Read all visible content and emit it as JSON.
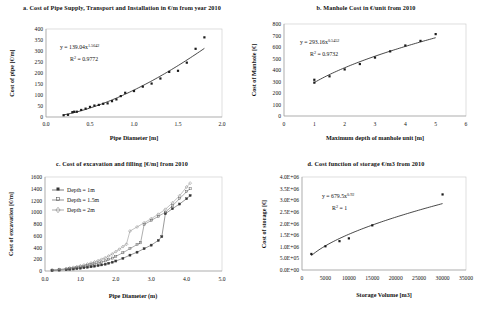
{
  "figure": {
    "name": "cost-function-figure",
    "panel_count": 4
  },
  "chart_data": [
    {
      "id": "a",
      "type": "scatter",
      "title": "a. Cost of Pipe Supply, Transport and Installation in €/m from year 2010",
      "xlabel": "Pipe Diameter [m]",
      "ylabel": "Cost of pipe [€/m]",
      "xlim": [
        0.0,
        2.0
      ],
      "ylim": [
        0,
        400
      ],
      "xticks": [
        "0.0",
        "0.5",
        "1.0",
        "1.5",
        "2.0"
      ],
      "yticks": [
        "0",
        "50",
        "100",
        "150",
        "200",
        "250",
        "300",
        "350",
        "400"
      ],
      "grid": false,
      "legend": "none",
      "equation": "y = 139.04x",
      "equation_exponent": "1.5642",
      "r_squared_label": "R",
      "r_squared_sup": "2",
      "r_squared_value": "= 0.9772",
      "trendline": "power",
      "x": [
        0.2,
        0.25,
        0.3,
        0.32,
        0.35,
        0.4,
        0.45,
        0.5,
        0.55,
        0.6,
        0.65,
        0.7,
        0.75,
        0.8,
        0.85,
        0.9,
        1.0,
        1.1,
        1.2,
        1.3,
        1.4,
        1.5,
        1.6,
        1.7,
        1.8
      ],
      "y": [
        8,
        10,
        22,
        24,
        24,
        32,
        38,
        46,
        52,
        55,
        60,
        62,
        72,
        80,
        95,
        110,
        118,
        138,
        152,
        175,
        205,
        210,
        247,
        310,
        362
      ]
    },
    {
      "id": "b",
      "type": "scatter",
      "title": "b. Manhole Cost in €/unit from 2010",
      "xlabel": "Maximum depth of manhole unit [m]",
      "ylabel": "Cost of Manhole [€]",
      "xlim": [
        0,
        6
      ],
      "ylim": [
        0,
        800
      ],
      "xticks": [
        "0",
        "1",
        "2",
        "3",
        "4",
        "5",
        "6"
      ],
      "yticks": [
        "0",
        "100",
        "200",
        "300",
        "400",
        "500",
        "600",
        "700",
        "800"
      ],
      "grid": false,
      "legend": "none",
      "equation": "y = 293.16x",
      "equation_exponent": "0.5452",
      "r_squared_label": "R",
      "r_squared_sup": "2",
      "r_squared_value": "= 0.9732",
      "trendline": "power",
      "x": [
        1.0,
        1.0,
        1.5,
        2.0,
        2.5,
        3.0,
        3.5,
        4.0,
        4.5,
        5.0
      ],
      "y": [
        290,
        315,
        345,
        405,
        452,
        508,
        562,
        613,
        653,
        712
      ]
    },
    {
      "id": "c",
      "type": "line",
      "title": "c. Cost of excavation and filling [€/m] from 2010",
      "xlabel": "Pipe Diameter (m)",
      "ylabel": "Cost of excavation [€/m]",
      "xlim": [
        0.0,
        5.0
      ],
      "ylim": [
        0,
        1600
      ],
      "xticks": [
        "0.0",
        "1.0",
        "2.0",
        "3.0",
        "4.0",
        "5.0"
      ],
      "yticks": [
        "0",
        "200",
        "400",
        "600",
        "800",
        "1000",
        "1200",
        "1400",
        "1600"
      ],
      "grid": false,
      "legend": "inside-upper-left",
      "series": [
        {
          "name": "Depth = 1m",
          "x": [
            0.2,
            0.4,
            0.6,
            0.7,
            0.8,
            0.9,
            1.0,
            1.1,
            1.2,
            1.3,
            1.4,
            1.5,
            1.6,
            1.7,
            1.8,
            1.9,
            2.0,
            2.2,
            2.4,
            2.6,
            2.8,
            3.0,
            3.2,
            3.3,
            3.4,
            3.6,
            3.8,
            4.0,
            4.1
          ],
          "y": [
            10,
            15,
            22,
            28,
            34,
            40,
            48,
            56,
            64,
            72,
            82,
            92,
            104,
            116,
            132,
            150,
            170,
            215,
            270,
            320,
            380,
            440,
            520,
            585,
            975,
            1060,
            1140,
            1230,
            1285
          ]
        },
        {
          "name": "Depth = 1.5m",
          "x": [
            0.2,
            0.4,
            0.6,
            0.7,
            0.8,
            0.9,
            1.0,
            1.1,
            1.2,
            1.3,
            1.4,
            1.5,
            1.6,
            1.7,
            1.8,
            1.9,
            2.0,
            2.2,
            2.4,
            2.6,
            2.7,
            2.8,
            3.0,
            3.2,
            3.4,
            3.6,
            3.8,
            4.0,
            4.1
          ],
          "y": [
            14,
            22,
            32,
            40,
            48,
            58,
            68,
            80,
            92,
            106,
            120,
            136,
            152,
            172,
            195,
            220,
            250,
            310,
            380,
            450,
            480,
            790,
            860,
            930,
            1000,
            1110,
            1230,
            1350,
            1400
          ]
        },
        {
          "name": "Depth = 2m",
          "x": [
            0.2,
            0.4,
            0.6,
            0.7,
            0.8,
            0.9,
            1.0,
            1.1,
            1.2,
            1.3,
            1.4,
            1.5,
            1.6,
            1.7,
            1.8,
            1.9,
            2.0,
            2.1,
            2.2,
            2.3,
            2.4,
            2.6,
            2.8,
            3.0,
            3.2,
            3.4,
            3.6,
            3.8,
            4.0,
            4.1
          ],
          "y": [
            18,
            28,
            42,
            52,
            62,
            74,
            88,
            102,
            118,
            136,
            154,
            175,
            198,
            224,
            255,
            290,
            330,
            370,
            415,
            455,
            680,
            750,
            820,
            890,
            965,
            1050,
            1160,
            1280,
            1430,
            1495
          ]
        }
      ]
    },
    {
      "id": "d",
      "type": "scatter",
      "title": "d. Cost function of storage €/m3 from 2010",
      "xlabel": "Storage Volume [m3]",
      "ylabel": "Cost of storage [€]",
      "xlim": [
        0,
        35000
      ],
      "ylim": [
        0,
        4000000
      ],
      "xticks": [
        "0",
        "5000",
        "10000",
        "15000",
        "20000",
        "25000",
        "30000",
        "35000"
      ],
      "yticks": [
        "0.0E+00",
        "5.0E+05",
        "1.0E+06",
        "1.5E+06",
        "2.0E+06",
        "2.5E+06",
        "3.0E+06",
        "3.5E+06",
        "4.0E+06"
      ],
      "grid": false,
      "legend": "none",
      "equation": "y = 679.5x",
      "equation_exponent": "0.92",
      "r_squared_label": "R",
      "r_squared_sup": "2",
      "r_squared_value": "= 1",
      "trendline": "power",
      "x": [
        2000,
        5000,
        8000,
        10000,
        15000,
        30000
      ],
      "y": [
        690000,
        1020000,
        1240000,
        1360000,
        1920000,
        3250000
      ]
    }
  ]
}
